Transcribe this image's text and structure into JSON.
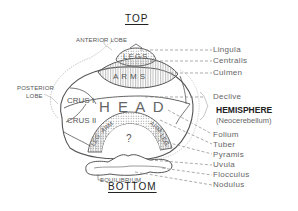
{
  "diagram": {
    "top_label": "TOP",
    "bottom_label": "BOTTOM",
    "left_labels": {
      "anterior_lobe": "ANTERIOR LOBE",
      "posterior_lobe_line1": "POSTERIOR",
      "posterior_lobe_line2": "LOBE"
    },
    "inner_labels": {
      "legs": "LEGS",
      "arms": "ARMS",
      "head": "H E A D",
      "crus1": "CRUS I",
      "crus2": "CRUS II",
      "lower_left_arm": "ARM",
      "lower_left_leg": "LEG",
      "lower_right_arm": "ARM",
      "lower_right_leg": "LEG",
      "unknown": "?",
      "equilibrium": "EQUILIBRIUM"
    },
    "right_labels": {
      "lingula": "Lingula",
      "centralis": "Centralis",
      "culmen": "Culmen",
      "declive": "Declive",
      "hemisphere": "HEMISPHERE",
      "neocerebellum": "(Neocerebellum)",
      "folium": "Folium",
      "tuber": "Tuber",
      "pyramis": "Pyramis",
      "uvula": "Uvula",
      "flocculus": "Flocculus",
      "nodulus": "Nodulus"
    },
    "colors": {
      "outline": "#555555",
      "leader": "#888888",
      "hatch": "#999999",
      "text": "#444444"
    }
  }
}
